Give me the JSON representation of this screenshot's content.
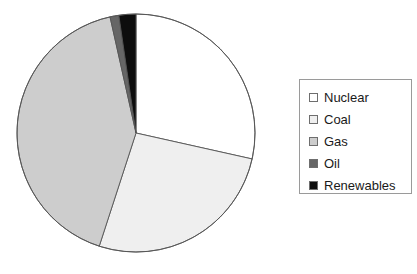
{
  "chart_data": {
    "type": "pie",
    "title": "",
    "subtitle": "",
    "xlabel": "",
    "ylabel": "",
    "grid": false,
    "legend_position": "right",
    "start_angle_deg": 0,
    "direction": "clockwise",
    "center": {
      "x": 136,
      "y": 133
    },
    "radius": 119,
    "categories": [
      "Nuclear",
      "Coal",
      "Gas",
      "Oil",
      "Renewables"
    ],
    "values": [
      28.5,
      26.5,
      41.5,
      1.2,
      2.3
    ],
    "units": "percent",
    "colors": [
      "#ffffff",
      "#efefef",
      "#cdcdcd",
      "#666666",
      "#0d0d0d"
    ],
    "slice_edge_color": "#555555",
    "slices": [
      {
        "label": "Nuclear",
        "value": 28.5,
        "color": "#ffffff",
        "start_deg": 0.0,
        "end_deg": 102.6
      },
      {
        "label": "Coal",
        "value": 26.5,
        "color": "#efefef",
        "start_deg": 102.6,
        "end_deg": 198.0
      },
      {
        "label": "Gas",
        "value": 41.5,
        "color": "#cdcdcd",
        "start_deg": 198.0,
        "end_deg": 347.4
      },
      {
        "label": "Oil",
        "value": 1.2,
        "color": "#666666",
        "start_deg": 347.4,
        "end_deg": 351.7
      },
      {
        "label": "Renewables",
        "value": 2.3,
        "color": "#0d0d0d",
        "start_deg": 351.7,
        "end_deg": 360.0
      }
    ]
  },
  "legend": {
    "border_color": "#9a9a9a",
    "background": "#ffffff",
    "items": [
      {
        "label": "Nuclear",
        "color": "#ffffff"
      },
      {
        "label": "Coal",
        "color": "#efefef"
      },
      {
        "label": "Gas",
        "color": "#cdcdcd"
      },
      {
        "label": "Oil",
        "color": "#666666"
      },
      {
        "label": "Renewables",
        "color": "#0d0d0d"
      }
    ]
  }
}
